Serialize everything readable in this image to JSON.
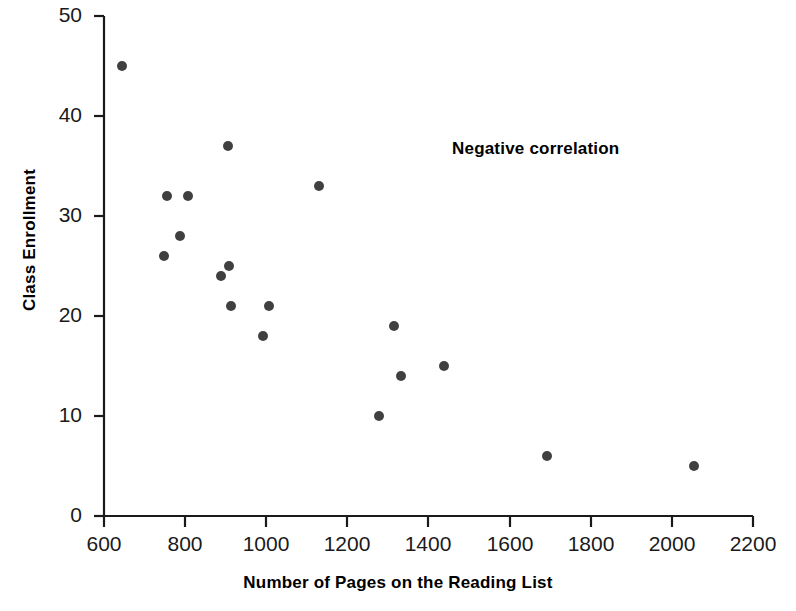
{
  "chart_data": {
    "type": "scatter",
    "title": "",
    "xlabel": "Number of Pages on the Reading List",
    "ylabel": "Class Enrollment",
    "xlim": [
      600,
      2200
    ],
    "ylim": [
      0,
      50
    ],
    "xticks": [
      600,
      800,
      1000,
      1200,
      1400,
      1600,
      1800,
      2000,
      2200
    ],
    "yticks": [
      0,
      10,
      20,
      30,
      40,
      50
    ],
    "grid": false,
    "legend": null,
    "annotations": [
      {
        "text": "Negative correlation",
        "x": 1480,
        "y": 37
      }
    ],
    "marker_color": "#404040",
    "points": [
      {
        "x": 645,
        "y": 45
      },
      {
        "x": 748,
        "y": 26
      },
      {
        "x": 755,
        "y": 32
      },
      {
        "x": 788,
        "y": 28
      },
      {
        "x": 807,
        "y": 32
      },
      {
        "x": 889,
        "y": 24
      },
      {
        "x": 905,
        "y": 37
      },
      {
        "x": 909,
        "y": 25
      },
      {
        "x": 914,
        "y": 21
      },
      {
        "x": 992,
        "y": 18
      },
      {
        "x": 1007,
        "y": 21
      },
      {
        "x": 1131,
        "y": 33
      },
      {
        "x": 1277,
        "y": 10
      },
      {
        "x": 1316,
        "y": 19
      },
      {
        "x": 1333,
        "y": 14
      },
      {
        "x": 1437,
        "y": 15
      },
      {
        "x": 1691,
        "y": 6
      },
      {
        "x": 2054,
        "y": 5
      }
    ],
    "xtick_labels": [
      "600",
      "800",
      "1000",
      "1200",
      "1400",
      "1600",
      "1800",
      "2000",
      "2200"
    ],
    "ytick_labels": [
      "0",
      "10",
      "20",
      "30",
      "40",
      "50"
    ]
  },
  "axis": {
    "color": "#1a1a1a"
  }
}
